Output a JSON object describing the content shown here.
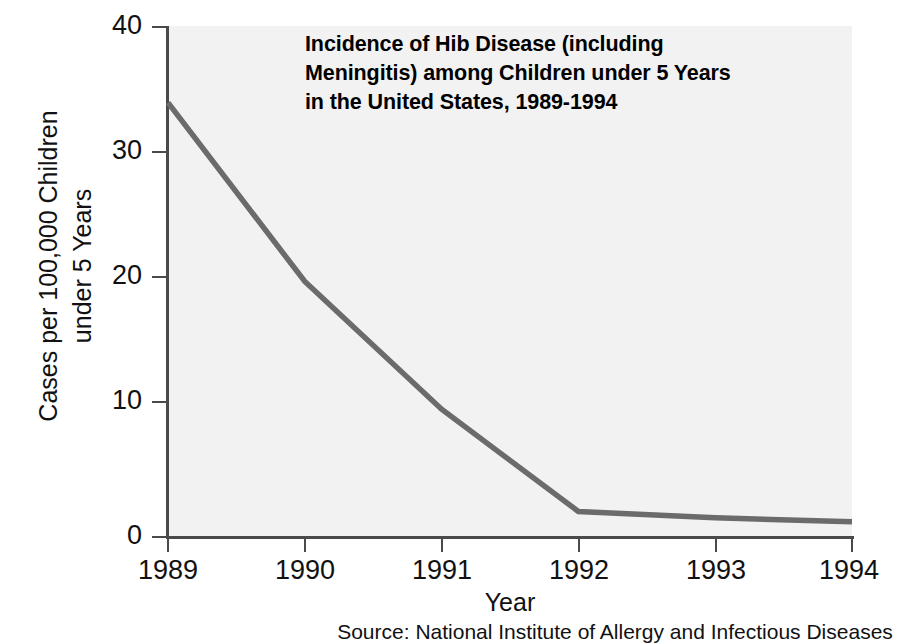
{
  "chart_data": {
    "type": "line",
    "title": "Incidence of Hib Disease (including Meningitis) among Children under 5 Years in the United States, 1989-1994",
    "title_lines": [
      "Incidence of Hib Disease (including",
      "Meningitis) among Children under 5 Years",
      "in the United States, 1989-1994"
    ],
    "xlabel": "Year",
    "ylabel": "Cases per 100,000 Children under 5 Years",
    "ylabel_lines": [
      "Cases per 100,000 Children",
      "under 5 Years"
    ],
    "categories": [
      "1989",
      "1990",
      "1991",
      "1992",
      "1993",
      "1994"
    ],
    "x": [
      1989,
      1990,
      1991,
      1992,
      1993,
      1994
    ],
    "values": [
      34,
      20,
      10,
      2,
      1.5,
      1.2
    ],
    "series": [
      {
        "name": "Hib Disease Incidence",
        "values": [
          34,
          20,
          10,
          2,
          1.5,
          1.2
        ]
      }
    ],
    "xlim": [
      1989,
      1994
    ],
    "ylim": [
      0,
      40
    ],
    "yticks": [
      0,
      10,
      20,
      30,
      40
    ],
    "ytick_labels": [
      "0",
      "10",
      "20",
      "30",
      "40"
    ],
    "xticks": [
      1989,
      1990,
      1991,
      1992,
      1993,
      1994
    ],
    "xtick_labels": [
      "1989",
      "1990",
      "1991",
      "1992",
      "1993",
      "1994"
    ],
    "grid": false,
    "legend": "none",
    "source_note": "Source: National Institute of Allergy and Infectious Diseases",
    "colors": {
      "line": "#6b6b6b",
      "plot_background": "#f2f2f2",
      "figure_background": "#ffffff",
      "axis": "#4a4a4a",
      "text": "#111111"
    }
  }
}
